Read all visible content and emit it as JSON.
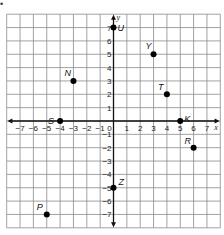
{
  "figure": {
    "marker": "•",
    "x_axis_label": "x",
    "y_axis_label": "y",
    "x_ticks": [
      "−7",
      "−6",
      "−5",
      "−4",
      "−3",
      "−2",
      "−1",
      "0",
      "1",
      "2",
      "3",
      "4",
      "5",
      "6",
      "7"
    ],
    "y_ticks_pos": [
      "7",
      "6",
      "5",
      "4",
      "3",
      "2",
      "1"
    ],
    "y_ticks_neg": [
      "−1",
      "−2",
      "−3",
      "−4",
      "−5",
      "−6",
      "−7"
    ],
    "points": [
      {
        "label": "U",
        "x": 0,
        "y": 7
      },
      {
        "label": "Y",
        "x": 3,
        "y": 5
      },
      {
        "label": "N",
        "x": -3,
        "y": 3
      },
      {
        "label": "T",
        "x": 4,
        "y": 2
      },
      {
        "label": "S",
        "x": -4,
        "y": 0
      },
      {
        "label": "K",
        "x": 5,
        "y": 0
      },
      {
        "label": "R",
        "x": 6,
        "y": -2
      },
      {
        "label": "Z",
        "x": 0,
        "y": -5
      },
      {
        "label": "P",
        "x": -5,
        "y": -7
      }
    ]
  }
}
